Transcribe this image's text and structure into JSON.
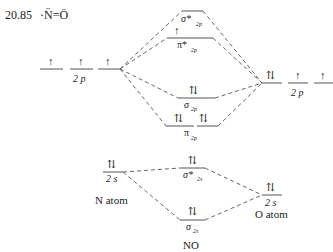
{
  "title": {
    "number": "20.85",
    "structure": "·N̈=Ö"
  },
  "left_atom": {
    "name": "N atom",
    "orbital_2p": {
      "label": "2 p",
      "electrons": [
        "↑",
        "↑",
        "↑"
      ]
    },
    "orbital_2s": {
      "label": "2 s",
      "electrons": "⇅"
    }
  },
  "right_atom": {
    "name": "O atom",
    "orbital_2p": {
      "label": "2 p",
      "electrons": [
        "⇅",
        "↑",
        "↑"
      ]
    },
    "orbital_2s": {
      "label": "2 s",
      "electrons": "⇅"
    }
  },
  "molecular_orbitals": {
    "sigma_star_2p": {
      "label": "σ*",
      "sub": "2p",
      "electrons": ""
    },
    "pi_star_2p": {
      "label": "π*",
      "sub": "2p",
      "electrons": "↑"
    },
    "sigma_2p": {
      "label": "σ",
      "sub": "2p",
      "electrons": "⇅"
    },
    "pi_2p": {
      "label": "π",
      "sub": "2p",
      "electrons": [
        "⇅",
        "⇅"
      ]
    },
    "sigma_star_2s": {
      "label": "σ*",
      "sub": "2s",
      "electrons": "⇅"
    },
    "sigma_2s": {
      "label": "σ",
      "sub": "2s",
      "electrons": "⇅"
    }
  },
  "molecule": "NO",
  "colors": {
    "line": "#555555",
    "text": "#222222"
  }
}
